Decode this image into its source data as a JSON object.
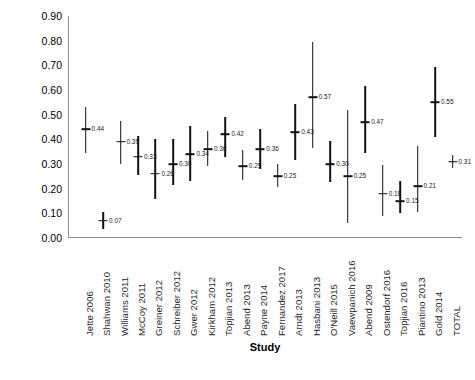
{
  "chart_data": {
    "type": "scatter",
    "title": "",
    "xlabel": "Study",
    "ylabel": "% with Seizures",
    "ylim": [
      0.0,
      0.9
    ],
    "yticks": [
      "0.00",
      "0.10",
      "0.20",
      "0.30",
      "0.40",
      "0.50",
      "0.60",
      "0.70",
      "0.80",
      "0.90"
    ],
    "grid": false,
    "legend": null,
    "categories": [
      "Jette 2006",
      "Shahwan 2010",
      "Williams 2011",
      "McCoy 2011",
      "Greiner 2012",
      "Schreiber 2012",
      "Gwer 2012",
      "Kirkham 2012",
      "Topjian 2013",
      "Abend 2013",
      "Payne 2014",
      "Fernandez 2017",
      "Arndt 2013",
      "Hasbani 2013",
      "O'Neill 2015",
      "Vaewpanich 2016",
      "Abend 2009",
      "Ostendorf 2016",
      "Topjian 2016",
      "Piantino 2013",
      "Gold 2014",
      "TOTAL"
    ],
    "values": [
      0.44,
      0.07,
      0.39,
      0.33,
      0.26,
      0.3,
      0.34,
      0.36,
      0.42,
      0.29,
      0.36,
      0.25,
      0.43,
      0.57,
      0.3,
      0.25,
      0.47,
      0.18,
      0.15,
      0.21,
      0.55,
      0.31
    ],
    "value_labels": [
      "0.44",
      "0.07",
      "0.39",
      "0.33",
      "0.26",
      "0.30",
      "0.34",
      "0.36",
      "0.42",
      "0.29",
      "0.36",
      "0.25",
      "0.43",
      "0.57",
      "0.30",
      "0.25",
      "0.47",
      "0.18",
      "0.15",
      "0.21",
      "0.55",
      "0.31"
    ],
    "ci_low": [
      0.345,
      0.035,
      0.3,
      0.255,
      0.16,
      0.215,
      0.23,
      0.29,
      0.33,
      0.235,
      0.28,
      0.205,
      0.315,
      0.365,
      0.225,
      0.06,
      0.345,
      0.09,
      0.1,
      0.105,
      0.41,
      0.285
    ],
    "ci_high": [
      0.53,
      0.105,
      0.475,
      0.415,
      0.4,
      0.4,
      0.455,
      0.435,
      0.49,
      0.355,
      0.44,
      0.3,
      0.545,
      0.795,
      0.395,
      0.52,
      0.615,
      0.295,
      0.23,
      0.375,
      0.695,
      0.335
    ]
  },
  "axis": {
    "ylabel": "% with Seizures",
    "xlabel": "Study"
  },
  "caption": {
    "text": ""
  }
}
